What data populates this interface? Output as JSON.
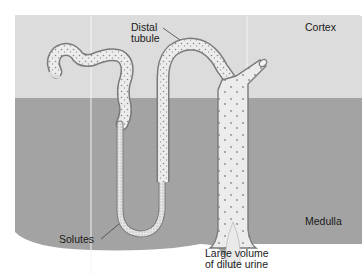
{
  "diagram": {
    "type": "nephron-diagram",
    "regions": {
      "cortex": {
        "label": "Cortex",
        "color": "#dcdcdc"
      },
      "medulla": {
        "label": "Medulla",
        "color": "#a3a3a3"
      }
    },
    "labels": {
      "distal_tubule_line1": "Distal",
      "distal_tubule_line2": "tubule",
      "solutes": "Solutes",
      "urine_line1": "Large volume",
      "urine_line2": "of dilute urine"
    },
    "colors": {
      "tubule_fill": "#ececec",
      "tubule_outline": "#7a7a7a",
      "dot_color": "#8a8a8a",
      "background": "#ffffff",
      "divider": "#f4f4f4"
    }
  }
}
